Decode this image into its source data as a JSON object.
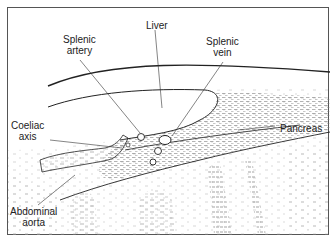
{
  "diagram": {
    "type": "anatomical-ultrasound-illustration",
    "labels": {
      "splenic_artery": [
        "Splenic",
        "artery"
      ],
      "liver": [
        "Liver"
      ],
      "splenic_vein": [
        "Splenic",
        "vein"
      ],
      "coeliac_axis": [
        "Coeliac",
        "axis"
      ],
      "pancreas": [
        "Pancreas"
      ],
      "abdominal_aorta": [
        "Abdominal",
        "aorta"
      ]
    },
    "colors": {
      "line": "#222222",
      "stipple": "#8a8a8a",
      "frame": "#555555",
      "background": "#ffffff"
    }
  }
}
